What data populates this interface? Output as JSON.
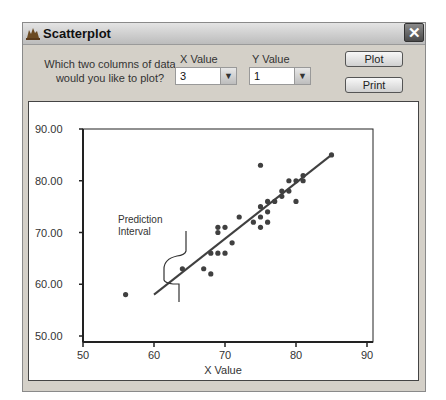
{
  "window": {
    "title": "Scatterplot",
    "close_label": "✕"
  },
  "controls": {
    "prompt_line1": "Which two columns of data",
    "prompt_line2": "would you like to plot?",
    "x_label": "X Value",
    "y_label": "Y Value",
    "x_selected": "3",
    "y_selected": "1",
    "plot_button": "Plot",
    "print_button": "Print"
  },
  "annotation": {
    "line1": "Prediction",
    "line2": "Interval"
  },
  "colors": {
    "points": "#404040",
    "line": "#404040",
    "axis": "#222222"
  },
  "chart_data": {
    "type": "scatter",
    "title": "",
    "xlabel": "X Value",
    "ylabel": "",
    "xlim": [
      50,
      90
    ],
    "ylim": [
      50,
      90
    ],
    "x_ticks": [
      "50",
      "60",
      "70",
      "80",
      "90"
    ],
    "y_ticks": [
      "50.00",
      "60.00",
      "70.00",
      "80.00",
      "90.00"
    ],
    "grid": false,
    "legend": "none",
    "annotations": [
      "Prediction Interval"
    ],
    "points": [
      [
        56,
        58
      ],
      [
        64,
        63
      ],
      [
        67,
        63
      ],
      [
        68,
        62
      ],
      [
        68,
        66
      ],
      [
        69,
        66
      ],
      [
        70,
        66
      ],
      [
        69,
        70
      ],
      [
        69,
        71
      ],
      [
        70,
        71
      ],
      [
        71,
        68
      ],
      [
        72,
        73
      ],
      [
        74,
        72
      ],
      [
        75,
        83
      ],
      [
        75,
        75
      ],
      [
        75,
        73
      ],
      [
        75,
        71
      ],
      [
        76,
        72
      ],
      [
        76,
        74
      ],
      [
        76,
        76
      ],
      [
        77,
        76
      ],
      [
        78,
        78
      ],
      [
        78,
        77
      ],
      [
        79,
        80
      ],
      [
        79,
        78
      ],
      [
        80,
        80
      ],
      [
        80,
        76
      ],
      [
        81,
        81
      ],
      [
        81,
        80
      ],
      [
        85,
        85
      ]
    ],
    "regression_line": [
      [
        60,
        58
      ],
      [
        85,
        85
      ]
    ]
  }
}
